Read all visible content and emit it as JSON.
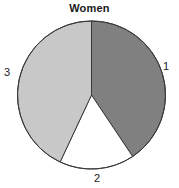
{
  "chart_data": {
    "type": "pie",
    "title": "Women",
    "subtitle": "",
    "xlabel": "",
    "ylabel": "",
    "legend_position": "none",
    "grid": false,
    "labels_position": "outside",
    "start_angle_deg": 0,
    "direction": "clockwise",
    "categories": [
      "1",
      "2",
      "3"
    ],
    "values": [
      40.6,
      16.4,
      43.0
    ],
    "slices": [
      {
        "label": "1",
        "value": 40.6,
        "start_angle_deg": 0,
        "end_angle_deg": 146.2,
        "sweep_deg": 146.2,
        "color": "#808080",
        "label_x": 168,
        "label_y": 66
      },
      {
        "label": "2",
        "value": 16.4,
        "start_angle_deg": 146.2,
        "end_angle_deg": 205.1,
        "sweep_deg": 58.9,
        "color": "#ffffff",
        "label_x": 99,
        "label_y": 178
      },
      {
        "label": "3",
        "value": 43.0,
        "start_angle_deg": 205.1,
        "end_angle_deg": 360,
        "sweep_deg": 154.9,
        "color": "#c8c8c8",
        "label_x": 9,
        "label_y": 72
      }
    ],
    "geometry": {
      "center_x": 91.5,
      "center_y": 95,
      "radius": 74
    },
    "style": {
      "background": "#ffffff",
      "outline_color": "#3a3a3a",
      "outline_width": 1,
      "title_color": "#1a1a1a",
      "label_color": "#1a1a1a"
    }
  }
}
